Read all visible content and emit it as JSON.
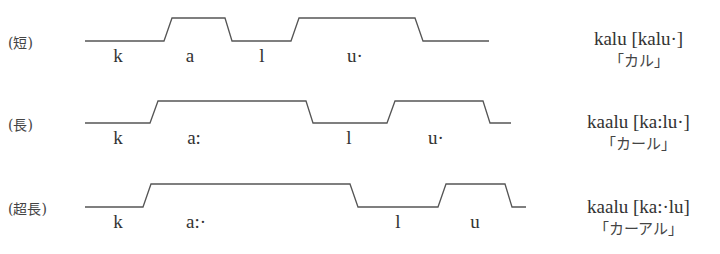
{
  "diagram": {
    "line_color": "#555555",
    "rows": [
      {
        "label": "(短)",
        "segments": [
          "k",
          "a",
          "l",
          "u·"
        ],
        "word": "kalu [kalu·]",
        "kana": "「カル」",
        "waveform": {
          "low_y": 41,
          "high_y": 18,
          "points": [
            [
              85,
              41
            ],
            [
              164,
              41
            ],
            [
              172,
              18
            ],
            [
              225,
              18
            ],
            [
              232,
              41
            ],
            [
              291,
              41
            ],
            [
              299,
              18
            ],
            [
              415,
              18
            ],
            [
              423,
              41
            ],
            [
              489,
              41
            ]
          ]
        }
      },
      {
        "label": "(長)",
        "segments": [
          "k",
          "a:",
          "l",
          "u·"
        ],
        "word": "kaalu [ka:lu·]",
        "kana": "「カール」",
        "waveform": {
          "low_y": 123,
          "high_y": 101,
          "points": [
            [
              85,
              123
            ],
            [
              150,
              123
            ],
            [
              158,
              101
            ],
            [
              306,
              101
            ],
            [
              313,
              123
            ],
            [
              387,
              123
            ],
            [
              395,
              101
            ],
            [
              483,
              101
            ],
            [
              490,
              123
            ],
            [
              511,
              123
            ]
          ]
        }
      },
      {
        "label": "(超長)",
        "segments": [
          "k",
          "a:·",
          "l",
          "u"
        ],
        "word": "kaalu [ka:·lu]",
        "kana": "「カーアル」",
        "waveform": {
          "low_y": 207,
          "high_y": 184,
          "points": [
            [
              85,
              207
            ],
            [
              143,
              207
            ],
            [
              151,
              184
            ],
            [
              350,
              184
            ],
            [
              358,
              207
            ],
            [
              438,
              207
            ],
            [
              446,
              184
            ],
            [
              505,
              184
            ],
            [
              512,
              207
            ],
            [
              526,
              207
            ]
          ]
        }
      }
    ]
  }
}
